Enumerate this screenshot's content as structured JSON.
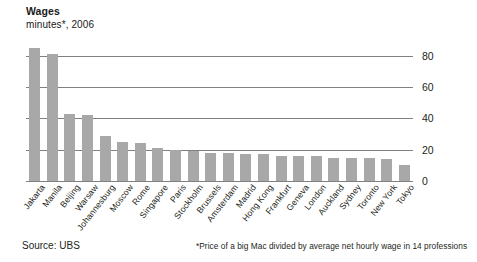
{
  "chart_data": {
    "type": "bar",
    "title": "Wages",
    "subtitle": "minutes*, 2006",
    "xlabel": "",
    "ylabel": "",
    "ylim": [
      0,
      90
    ],
    "yticks": [
      0,
      20,
      40,
      60,
      80
    ],
    "grid": true,
    "legend": null,
    "bar_color": "#a8a8a8",
    "gridline_color": "#808080",
    "categories": [
      "Jakarta",
      "Manila",
      "Beijing",
      "Warsaw",
      "Johannesburg",
      "Moscow",
      "Rome",
      "Singapore",
      "Paris",
      "Stockholm",
      "Brussels",
      "Amsterdam",
      "Madrid",
      "Hong Kong",
      "Frankfurt",
      "Geneva",
      "London",
      "Auckland",
      "Sydney",
      "Toronto",
      "New York",
      "Tokyo"
    ],
    "values": [
      85,
      81,
      43,
      42,
      29,
      25,
      24,
      21,
      20,
      19,
      18,
      18,
      17,
      17,
      16,
      16,
      16,
      15,
      15,
      15,
      14,
      10
    ],
    "annotations": {
      "source": "Source: UBS",
      "footnote": "*Price of a big Mac divided by average net hourly wage in 14 professions"
    }
  }
}
